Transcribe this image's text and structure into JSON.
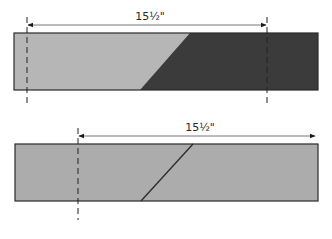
{
  "diagrams": [
    {
      "id": "top",
      "dimension_label": "15½\"",
      "strip": {
        "x": 14,
        "y": 33,
        "width": 304,
        "height": 57
      },
      "left_color": "#b6b6b6",
      "right_color": "#3b3b3b",
      "diagonal": {
        "x1": 190,
        "y1": 33,
        "x2": 140,
        "y2": 90
      },
      "dim_line": {
        "x1": 27,
        "x2": 267,
        "y": 25
      },
      "label_pos": {
        "x": 150,
        "y": 20
      },
      "guides": [
        {
          "x": 27,
          "y1": 17,
          "y2": 106
        },
        {
          "x": 267,
          "y1": 17,
          "y2": 106
        }
      ]
    },
    {
      "id": "bottom",
      "dimension_label": "15½\"",
      "strip": {
        "x": 15,
        "y": 144,
        "width": 303,
        "height": 57
      },
      "left_color": "#acacac",
      "right_color": "#acacac",
      "diagonal": {
        "x1": 193,
        "y1": 144,
        "x2": 141,
        "y2": 201
      },
      "dim_line": {
        "x1": 78,
        "x2": 316,
        "y": 136
      },
      "label_pos": {
        "x": 200,
        "y": 131
      },
      "guides": [
        {
          "x": 78,
          "y1": 128,
          "y2": 220
        }
      ]
    }
  ],
  "colors": {
    "outline": "#2a2a2a",
    "dim_line": "#777777",
    "arrow": "#1a1a1a",
    "guide": "#222222"
  }
}
